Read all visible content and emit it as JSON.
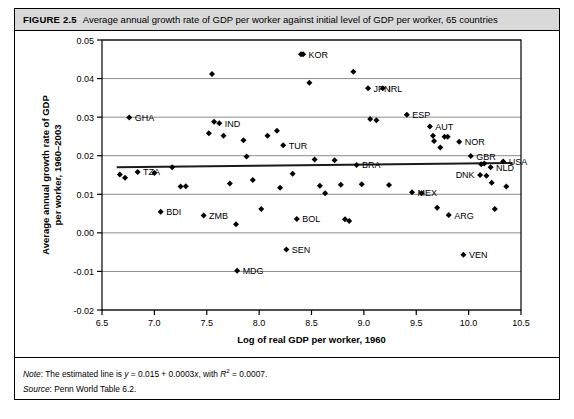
{
  "figure": {
    "label": "FIGURE 2.5",
    "caption": "Average annual growth rate of GDP per worker against initial level of GDP per worker, 65 countries",
    "note_key": "Note",
    "note_text": ": The estimated line is y = 0.015 + 0.0003x, with R² = 0.0007.",
    "source_key": "Source",
    "source_text": ": Penn World Table 6.2."
  },
  "chart_data": {
    "type": "scatter",
    "title": "Average annual growth rate of GDP per worker against initial level of GDP per worker, 65 countries",
    "xlabel": "Log of real GDP per worker, 1960",
    "ylabel": "Average annual growth rate of GDP per worker, 1960–2003",
    "xlim": [
      6.5,
      10.5
    ],
    "ylim": [
      -0.02,
      0.05
    ],
    "xticks": [
      "6.5",
      "7.0",
      "7.5",
      "8.0",
      "8.5",
      "9.0",
      "9.5",
      "10.0",
      "10.5"
    ],
    "xtick_values": [
      6.5,
      7.0,
      7.5,
      8.0,
      8.5,
      9.0,
      9.5,
      10.0,
      10.5
    ],
    "yticks": [
      "0.05",
      "0.04",
      "0.03",
      "0.02",
      "0.01",
      "0.00",
      "-0.01",
      "-0.02"
    ],
    "ytick_values": [
      0.05,
      0.04,
      0.03,
      0.02,
      0.01,
      0.0,
      -0.01,
      -0.02
    ],
    "grid": true,
    "legend": false,
    "marker": "diamond",
    "marker_color": "#000000",
    "trendline": {
      "label": "estimated line",
      "equation": "y = 0.015 + 0.0003x",
      "r_squared": 0.0007,
      "intercept": 0.015,
      "slope": 0.0003,
      "x_start": 6.64,
      "x_end": 10.42,
      "color": "#1a1a1a"
    },
    "points": [
      {
        "label": "",
        "x": 6.67,
        "y": 0.0151
      },
      {
        "label": "",
        "x": 6.72,
        "y": 0.0143
      },
      {
        "label": "GHA",
        "x": 6.76,
        "y": 0.0299,
        "label_pos": "right"
      },
      {
        "label": "TZA",
        "x": 6.84,
        "y": 0.0158,
        "label_pos": "right"
      },
      {
        "label": "",
        "x": 7.0,
        "y": 0.0155
      },
      {
        "label": "BDI",
        "x": 7.06,
        "y": 0.0055,
        "label_pos": "right"
      },
      {
        "label": "",
        "x": 7.17,
        "y": 0.017
      },
      {
        "label": "",
        "x": 7.25,
        "y": 0.012
      },
      {
        "label": "",
        "x": 7.3,
        "y": 0.0121
      },
      {
        "label": "ZMB",
        "x": 7.47,
        "y": 0.0045,
        "label_pos": "right"
      },
      {
        "label": "",
        "x": 7.52,
        "y": 0.0258
      },
      {
        "label": "",
        "x": 7.55,
        "y": 0.0412
      },
      {
        "label": "",
        "x": 7.57,
        "y": 0.0288
      },
      {
        "label": "IND",
        "x": 7.62,
        "y": 0.0284,
        "label_pos": "right"
      },
      {
        "label": "",
        "x": 7.66,
        "y": 0.0252
      },
      {
        "label": "",
        "x": 7.72,
        "y": 0.0128
      },
      {
        "label": "",
        "x": 7.78,
        "y": 0.0022
      },
      {
        "label": "MDG",
        "x": 7.79,
        "y": -0.0098,
        "label_pos": "right"
      },
      {
        "label": "",
        "x": 7.85,
        "y": 0.024
      },
      {
        "label": "",
        "x": 7.88,
        "y": 0.0198
      },
      {
        "label": "",
        "x": 7.94,
        "y": 0.0137
      },
      {
        "label": "",
        "x": 8.02,
        "y": 0.0062
      },
      {
        "label": "",
        "x": 8.08,
        "y": 0.0252
      },
      {
        "label": "",
        "x": 8.17,
        "y": 0.0265
      },
      {
        "label": "",
        "x": 8.2,
        "y": 0.0117
      },
      {
        "label": "TUR",
        "x": 8.23,
        "y": 0.0227,
        "label_pos": "right"
      },
      {
        "label": "SEN",
        "x": 8.26,
        "y": -0.0043,
        "label_pos": "right"
      },
      {
        "label": "",
        "x": 8.32,
        "y": 0.0153
      },
      {
        "label": "BOL",
        "x": 8.36,
        "y": 0.0036,
        "label_pos": "right"
      },
      {
        "label": "",
        "x": 8.4,
        "y": 0.0463
      },
      {
        "label": "KOR",
        "x": 8.42,
        "y": 0.0463,
        "label_pos": "right"
      },
      {
        "label": "",
        "x": 8.48,
        "y": 0.0389
      },
      {
        "label": "",
        "x": 8.53,
        "y": 0.019
      },
      {
        "label": "",
        "x": 8.58,
        "y": 0.0122
      },
      {
        "label": "",
        "x": 8.63,
        "y": 0.0103
      },
      {
        "label": "",
        "x": 8.72,
        "y": 0.0188
      },
      {
        "label": "",
        "x": 8.78,
        "y": 0.0125
      },
      {
        "label": "",
        "x": 8.82,
        "y": 0.0035
      },
      {
        "label": "",
        "x": 8.86,
        "y": 0.0031
      },
      {
        "label": "",
        "x": 8.9,
        "y": 0.0418
      },
      {
        "label": "BRA",
        "x": 8.93,
        "y": 0.0176,
        "label_pos": "right"
      },
      {
        "label": "",
        "x": 8.98,
        "y": 0.0126
      },
      {
        "label": "JPN",
        "x": 9.04,
        "y": 0.0375,
        "label_pos": "right"
      },
      {
        "label": "",
        "x": 9.06,
        "y": 0.0295
      },
      {
        "label": "",
        "x": 9.12,
        "y": 0.0292
      },
      {
        "label": "IRL",
        "x": 9.18,
        "y": 0.0375,
        "label_pos": "right"
      },
      {
        "label": "",
        "x": 9.24,
        "y": 0.0124
      },
      {
        "label": "ESP",
        "x": 9.41,
        "y": 0.0306,
        "label_pos": "right"
      },
      {
        "label": "MEX",
        "x": 9.46,
        "y": 0.0105,
        "label_pos": "right"
      },
      {
        "label": "",
        "x": 9.55,
        "y": 0.0103
      },
      {
        "label": "AUT",
        "x": 9.63,
        "y": 0.0276,
        "label_pos": "right"
      },
      {
        "label": "",
        "x": 9.66,
        "y": 0.0252
      },
      {
        "label": "",
        "x": 9.67,
        "y": 0.0238
      },
      {
        "label": "",
        "x": 9.7,
        "y": 0.0065
      },
      {
        "label": "",
        "x": 9.73,
        "y": 0.0221
      },
      {
        "label": "",
        "x": 9.77,
        "y": 0.0249
      },
      {
        "label": "",
        "x": 9.8,
        "y": 0.0249
      },
      {
        "label": "ARG",
        "x": 9.81,
        "y": 0.0046,
        "label_pos": "right"
      },
      {
        "label": "NOR",
        "x": 9.91,
        "y": 0.0236,
        "label_pos": "right"
      },
      {
        "label": "VEN",
        "x": 9.95,
        "y": -0.0057,
        "label_pos": "right"
      },
      {
        "label": "GBR",
        "x": 10.02,
        "y": 0.0199,
        "label_pos": "right"
      },
      {
        "label": "DNK",
        "x": 10.11,
        "y": 0.015,
        "label_pos": "left"
      },
      {
        "label": "",
        "x": 10.12,
        "y": 0.0178
      },
      {
        "label": "",
        "x": 10.15,
        "y": 0.018
      },
      {
        "label": "",
        "x": 10.17,
        "y": 0.0148
      },
      {
        "label": "NLD",
        "x": 10.21,
        "y": 0.017,
        "label_pos": "right"
      },
      {
        "label": "",
        "x": 10.22,
        "y": 0.013
      },
      {
        "label": "",
        "x": 10.25,
        "y": 0.0062
      },
      {
        "label": "USA",
        "x": 10.33,
        "y": 0.0185,
        "label_pos": "right"
      },
      {
        "label": "",
        "x": 10.36,
        "y": 0.012
      }
    ]
  }
}
